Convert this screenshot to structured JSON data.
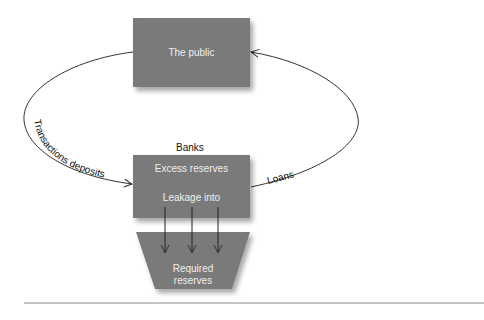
{
  "diagram": {
    "nodes": {
      "public": {
        "label": "The public"
      },
      "banks": {
        "title": "Banks",
        "line1": "Excess reserves",
        "line2": "Leakage into"
      },
      "required": {
        "line1": "Required",
        "line2": "reserves"
      }
    },
    "edges": {
      "deposits": "Transactions deposits",
      "loans": "Loans"
    },
    "colors": {
      "box": "#7a7a7a",
      "line": "#333333",
      "text": "#f0f0f0"
    }
  }
}
